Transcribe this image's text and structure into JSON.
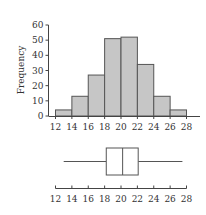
{
  "chart_data": [
    {
      "type": "bar",
      "subtype": "histogram",
      "title": "",
      "xlabel": "",
      "ylabel": "Frequency",
      "bin_edges": [
        12,
        14,
        16,
        18,
        20,
        22,
        24,
        26,
        28
      ],
      "categories": [
        "12-14",
        "14-16",
        "16-18",
        "18-20",
        "20-22",
        "22-24",
        "24-26",
        "26-28"
      ],
      "values": [
        4,
        13,
        27,
        51,
        52,
        34,
        13,
        4
      ],
      "xticks": [
        12,
        14,
        16,
        18,
        20,
        22,
        24,
        26,
        28
      ],
      "yticks": [
        0,
        10,
        20,
        30,
        40,
        50,
        60
      ],
      "xlim": [
        12,
        28
      ],
      "ylim": [
        0,
        60
      ],
      "grid": false,
      "legend": null,
      "colors": {
        "fill": "#c6c6c6",
        "stroke": "#555555"
      }
    },
    {
      "type": "boxplot",
      "orientation": "horizontal",
      "title": "",
      "xlabel": "",
      "whisker_low": 13,
      "q1": 18.2,
      "median": 20.2,
      "q3": 22.1,
      "whisker_high": 27.5,
      "xticks": [
        12,
        14,
        16,
        18,
        20,
        22,
        24,
        26,
        28
      ],
      "xlim": [
        12,
        28
      ],
      "colors": {
        "stroke": "#555555",
        "fill": "#ffffff"
      }
    }
  ]
}
